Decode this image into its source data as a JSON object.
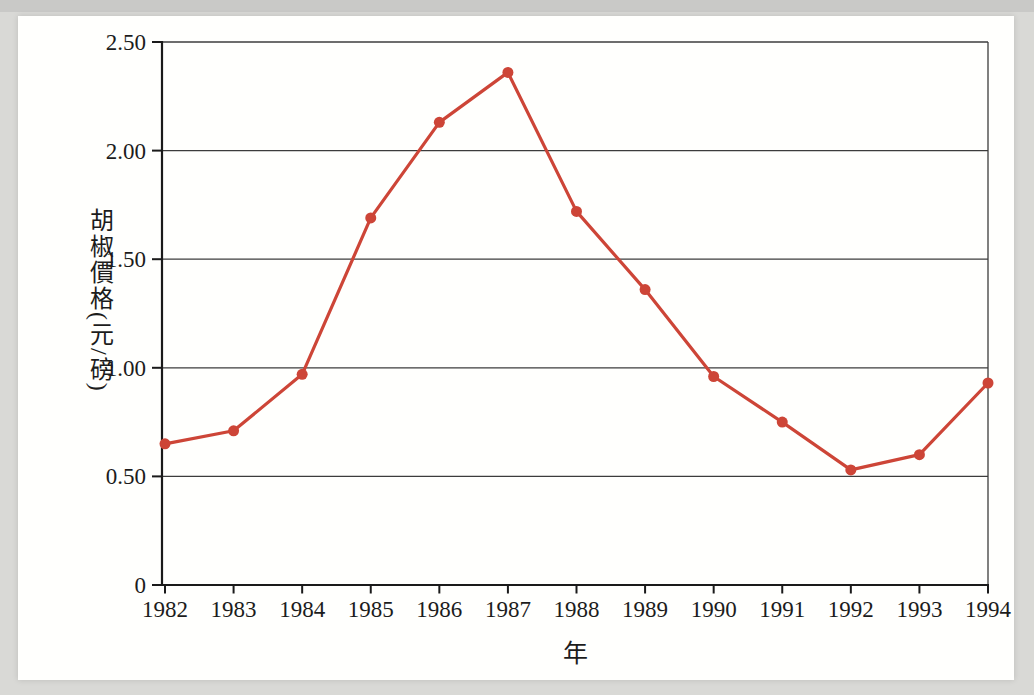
{
  "page": {
    "background_color": "#d9d9d6",
    "top_shade_color": "#c9c9c7",
    "panel_color": "#fffffd"
  },
  "chart_data": {
    "type": "line",
    "title": "",
    "xlabel": "年",
    "ylabel": "胡椒價格(元/磅)",
    "categories": [
      "1982",
      "1983",
      "1984",
      "1985",
      "1986",
      "1987",
      "1988",
      "1989",
      "1990",
      "1991",
      "1992",
      "1993",
      "1994"
    ],
    "values": [
      0.65,
      0.71,
      0.97,
      1.69,
      2.13,
      2.36,
      1.72,
      1.36,
      0.96,
      0.75,
      0.53,
      0.6,
      0.93
    ],
    "ylim": [
      0,
      2.5
    ],
    "y_ticks": [
      0,
      0.5,
      1.0,
      1.5,
      2.0,
      2.5
    ],
    "y_tick_labels": [
      "0",
      "0.50",
      "1.00",
      "1.50",
      "2.00",
      "2.50"
    ],
    "grid": true,
    "legend": false,
    "line_color": "#cd4537",
    "marker": "circle",
    "grid_color": "#3c3c3c",
    "axis_color": "#1a1a1a",
    "text_color": "#1c1c1c"
  }
}
